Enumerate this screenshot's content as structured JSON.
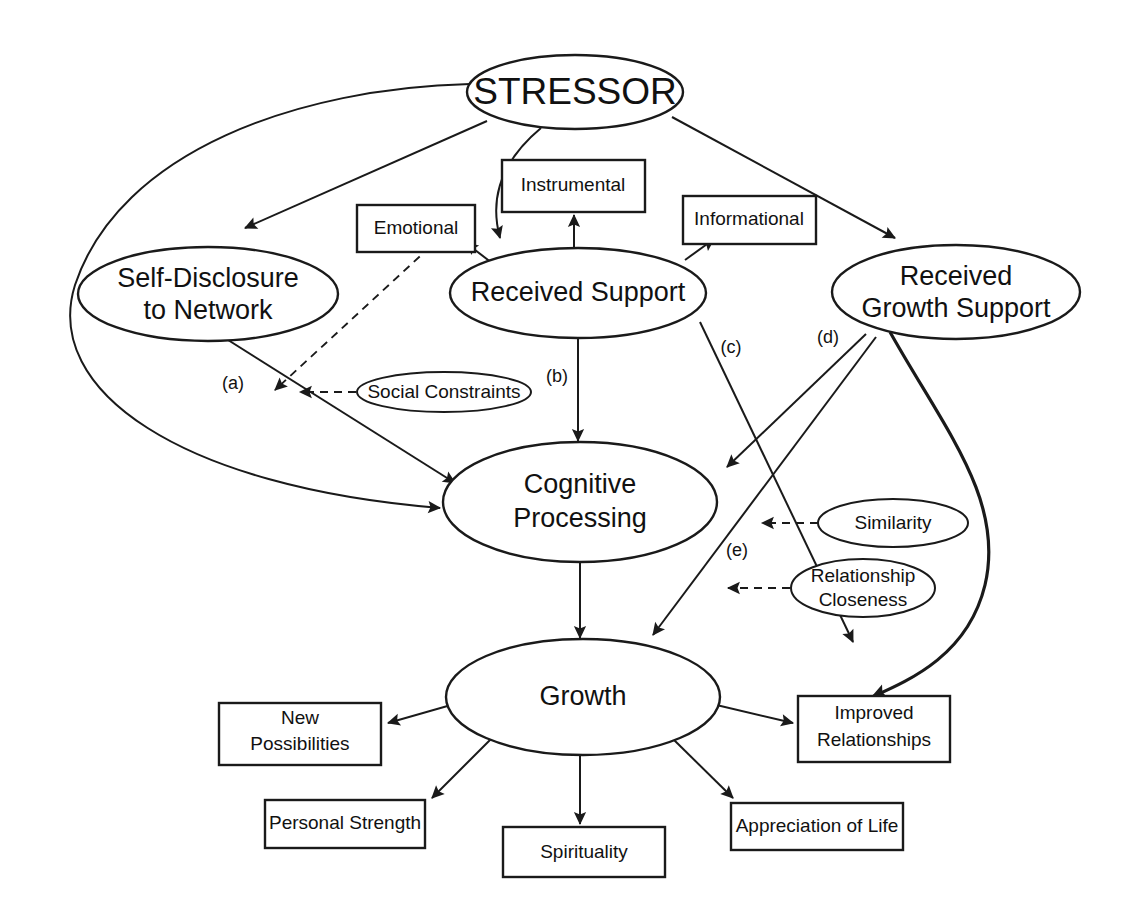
{
  "diagram": {
    "type": "path-model-diagram",
    "colors": {
      "stroke": "#1a1a1a",
      "fill": "#ffffff",
      "text": "#111111",
      "background": "#ffffff"
    },
    "nodes": {
      "stressor": {
        "label": "STRESSOR",
        "shape": "ellipse"
      },
      "self_disclosure": {
        "line1": "Self-Disclosure",
        "line2": "to Network",
        "shape": "ellipse"
      },
      "received_support": {
        "label": "Received Support",
        "shape": "ellipse"
      },
      "received_growth_support": {
        "line1": "Received",
        "line2": "Growth Support",
        "shape": "ellipse"
      },
      "cognitive_processing": {
        "line1": "Cognitive",
        "line2": "Processing",
        "shape": "ellipse"
      },
      "growth": {
        "label": "Growth",
        "shape": "ellipse"
      },
      "social_constraints": {
        "label": "Social Constraints",
        "shape": "ellipse"
      },
      "similarity": {
        "label": "Similarity",
        "shape": "ellipse"
      },
      "relationship_closeness": {
        "line1": "Relationship",
        "line2": "Closeness",
        "shape": "ellipse"
      },
      "emotional": {
        "label": "Emotional",
        "shape": "rect"
      },
      "instrumental": {
        "label": "Instrumental",
        "shape": "rect"
      },
      "informational": {
        "label": "Informational",
        "shape": "rect"
      },
      "new_possibilities": {
        "line1": "New",
        "line2": "Possibilities",
        "shape": "rect"
      },
      "personal_strength": {
        "label": "Personal Strength",
        "shape": "rect"
      },
      "spirituality": {
        "label": "Spirituality",
        "shape": "rect"
      },
      "appreciation_of_life": {
        "label": "Appreciation of Life",
        "shape": "rect"
      },
      "improved_relationships": {
        "line1": "Improved",
        "line2": "Relationships",
        "shape": "rect"
      }
    },
    "path_labels": {
      "a": "(a)",
      "b": "(b)",
      "c": "(c)",
      "d": "(d)",
      "e": "(e)"
    },
    "edges": [
      {
        "id": "stressor-to-self-disclosure",
        "from": "STRESSOR",
        "to": "Self-Disclosure to Network",
        "style": "solid-arrow"
      },
      {
        "id": "stressor-to-received-support",
        "from": "STRESSOR",
        "to": "Received Support",
        "style": "solid-arrow-curved"
      },
      {
        "id": "stressor-to-received-growth-support",
        "from": "STRESSOR",
        "to": "Received Growth Support",
        "style": "solid-arrow"
      },
      {
        "id": "stressor-to-cognitive-processing",
        "from": "STRESSOR",
        "to": "Cognitive Processing",
        "style": "solid-arrow-curved-left"
      },
      {
        "id": "self-disclosure-to-cognitive-processing",
        "from": "Self-Disclosure to Network",
        "to": "Cognitive Processing",
        "style": "solid-arrow",
        "label": "(a)"
      },
      {
        "id": "received-support-to-emotional",
        "from": "Received Support",
        "to": "Emotional",
        "style": "solid-arrow"
      },
      {
        "id": "received-support-to-instrumental",
        "from": "Received Support",
        "to": "Instrumental",
        "style": "solid-arrow"
      },
      {
        "id": "received-support-to-informational",
        "from": "Received Support",
        "to": "Informational",
        "style": "solid-arrow"
      },
      {
        "id": "received-support-to-cognitive-processing",
        "from": "Received Support",
        "to": "Cognitive Processing",
        "style": "solid-arrow",
        "label": "(b)"
      },
      {
        "id": "received-support-to-growth",
        "from": "Received Support",
        "to": "Growth",
        "style": "solid-arrow",
        "label": "(c)"
      },
      {
        "id": "received-growth-support-to-cognitive-processing",
        "from": "Received Growth Support",
        "to": "Cognitive Processing",
        "style": "solid-arrow",
        "label": "(d)"
      },
      {
        "id": "received-growth-support-to-growth",
        "from": "Received Growth Support",
        "to": "Growth",
        "style": "solid-arrow",
        "label": "(e)"
      },
      {
        "id": "received-growth-support-to-improved-relationships",
        "from": "Received Growth Support",
        "to": "Improved Relationships",
        "style": "thick-curved-arrow"
      },
      {
        "id": "cognitive-processing-to-growth",
        "from": "Cognitive Processing",
        "to": "Growth",
        "style": "solid-arrow"
      },
      {
        "id": "emotional-moderates-path-a",
        "from": "Emotional",
        "to": "path (a)",
        "style": "dashed-arrow"
      },
      {
        "id": "social-constraints-moderates-path-a",
        "from": "Social Constraints",
        "to": "path (a)",
        "style": "dashed-arrow"
      },
      {
        "id": "similarity-moderates-path-e",
        "from": "Similarity",
        "to": "path (e)",
        "style": "dashed-arrow"
      },
      {
        "id": "relationship-closeness-moderates-path-e",
        "from": "Relationship Closeness",
        "to": "path (e)",
        "style": "dashed-arrow"
      },
      {
        "id": "growth-to-new-possibilities",
        "from": "Growth",
        "to": "New Possibilities",
        "style": "solid-arrow"
      },
      {
        "id": "growth-to-personal-strength",
        "from": "Growth",
        "to": "Personal Strength",
        "style": "solid-arrow"
      },
      {
        "id": "growth-to-spirituality",
        "from": "Growth",
        "to": "Spirituality",
        "style": "solid-arrow"
      },
      {
        "id": "growth-to-appreciation-of-life",
        "from": "Growth",
        "to": "Appreciation of Life",
        "style": "solid-arrow"
      },
      {
        "id": "growth-to-improved-relationships",
        "from": "Growth",
        "to": "Improved Relationships",
        "style": "solid-arrow"
      }
    ]
  }
}
